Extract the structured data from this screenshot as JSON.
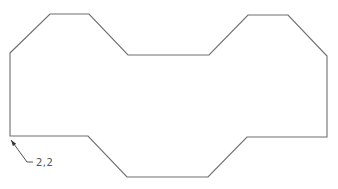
{
  "diagram": {
    "type": "cad-outline",
    "shape": {
      "name": "octagonal-profile",
      "stroke_color": "#6e6e6e",
      "points": [
        [
          10,
          53
        ],
        [
          50,
          14
        ],
        [
          89,
          14
        ],
        [
          128,
          55
        ],
        [
          209,
          55
        ],
        [
          248,
          15
        ],
        [
          288,
          15
        ],
        [
          327,
          56
        ],
        [
          327,
          137
        ],
        [
          247,
          137
        ],
        [
          208,
          177
        ],
        [
          127,
          177
        ],
        [
          88,
          136
        ],
        [
          10,
          136
        ]
      ]
    },
    "annotation": {
      "label": "2,2",
      "arrow_tip": [
        11,
        140
      ],
      "leader_bend": [
        27,
        162
      ],
      "leader_end": [
        33,
        162
      ],
      "text_position": [
        36,
        166
      ]
    }
  }
}
